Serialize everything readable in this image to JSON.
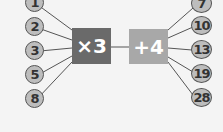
{
  "diagram": {
    "inputs": [
      "1",
      "2",
      "3",
      "5",
      "8"
    ],
    "operations": [
      {
        "label": "×3",
        "color": "#6a6a6a"
      },
      {
        "label": "+4",
        "color": "#a8a8a8"
      }
    ],
    "outputs": [
      "7",
      "10",
      "13",
      "19",
      "28"
    ]
  }
}
